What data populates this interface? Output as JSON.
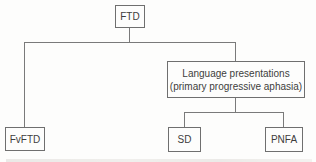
{
  "diagram": {
    "nodes": {
      "ftd": {
        "label": "FTD"
      },
      "fvftd": {
        "label": "FvFTD"
      },
      "language": {
        "line1": "Language presentations",
        "line2": "(primary progressive aphasia)"
      },
      "sd": {
        "label": "SD"
      },
      "pnfa": {
        "label": "PNFA"
      }
    },
    "edges": [
      {
        "from": "ftd",
        "to": "fvftd"
      },
      {
        "from": "ftd",
        "to": "language"
      },
      {
        "from": "language",
        "to": "sd"
      },
      {
        "from": "language",
        "to": "pnfa"
      }
    ],
    "colors": {
      "border": "#6f6f6f",
      "line": "#7a7a7a",
      "text": "#3d3d3d",
      "bg": "#fdfdfc"
    }
  }
}
